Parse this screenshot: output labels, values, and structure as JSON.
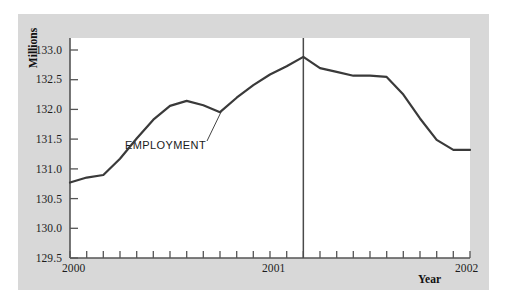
{
  "figure": {
    "background_color": "#ffffff",
    "panel_color": "#d8d8d8",
    "plot_background": "#ffffff"
  },
  "chart_data": {
    "type": "line",
    "title": "",
    "subtitle": "",
    "xlabel": "Year",
    "ylabel": "Millions",
    "ylim": [
      129.5,
      133.0
    ],
    "xlim": [
      2000.0,
      2002.0
    ],
    "yticks": [
      129.5,
      130.0,
      130.5,
      131.0,
      131.5,
      132.0,
      132.5,
      133.0
    ],
    "ytick_labels": [
      "129.5",
      "130.0",
      "130.5",
      "131.0",
      "131.5",
      "132.0",
      "132.5",
      "133.0"
    ],
    "xticks": [
      2000,
      2001,
      2002
    ],
    "xtick_labels": [
      "2000",
      "2001",
      "2002"
    ],
    "x_minor_tick_interval_months": 1,
    "grid": false,
    "legend": "none",
    "line_color": "#3a3a3a",
    "line_width_px": 2.2,
    "annotations": [
      {
        "text": "EMPLOYMENT",
        "type": "series-label",
        "leader_line": true
      }
    ],
    "reference_line": {
      "orientation": "vertical",
      "x": 2001.1667,
      "label": "",
      "color": "#4a4a4a"
    },
    "series": [
      {
        "name": "EMPLOYMENT",
        "x": [
          2000.0,
          2000.0833,
          2000.1667,
          2000.25,
          2000.3333,
          2000.4167,
          2000.5,
          2000.5833,
          2000.6667,
          2000.75,
          2000.8333,
          2000.9167,
          2001.0,
          2001.0833,
          2001.1667,
          2001.25,
          2001.3333,
          2001.4167,
          2001.5,
          2001.5833,
          2001.6667,
          2001.75,
          2001.8333,
          2001.9167,
          2002.0
        ],
        "values": [
          130.7,
          130.78,
          130.82,
          131.08,
          131.4,
          131.7,
          131.92,
          132.0,
          131.93,
          131.82,
          132.05,
          132.25,
          132.42,
          132.55,
          132.7,
          132.52,
          132.46,
          132.4,
          132.4,
          132.38,
          132.1,
          131.72,
          131.38,
          131.22,
          131.22
        ]
      }
    ]
  },
  "axis": {
    "y_title": "Millions",
    "x_title": "Year"
  }
}
